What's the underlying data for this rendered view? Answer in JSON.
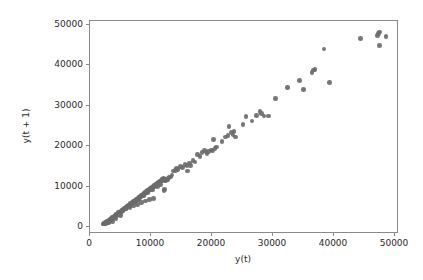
{
  "figure": {
    "background_color": "#ffffff",
    "width": 423,
    "height": 280
  },
  "axes": {
    "frame_color": "#8a8a8a",
    "left_px": 89,
    "top_px": 20,
    "right_px": 398,
    "bottom_px": 233
  },
  "chart_data": {
    "type": "scatter",
    "title": "",
    "xlabel": "y(t)",
    "ylabel": "y(t + 1)",
    "xlim": [
      -2200,
      52500
    ],
    "ylim": [
      -2400,
      52800
    ],
    "xticks": [
      0,
      10000,
      20000,
      30000,
      40000,
      50000
    ],
    "xticklabels": [
      "0",
      "10000",
      "20000",
      "30000",
      "40000",
      "50000"
    ],
    "yticks": [
      0,
      10000,
      20000,
      30000,
      40000,
      50000
    ],
    "yticklabels": [
      "0",
      "10000",
      "20000",
      "30000",
      "40000",
      "50000"
    ],
    "grid": false,
    "legend": null,
    "marker": {
      "shape": "circle",
      "color": "#6b6b6b",
      "size_px": 4.6
    },
    "series": [
      {
        "name": "lag-1 scatter",
        "color": "#6b6b6b",
        "points": [
          [
            300,
            250
          ],
          [
            420,
            380
          ],
          [
            520,
            300
          ],
          [
            610,
            520
          ],
          [
            700,
            640
          ],
          [
            760,
            500
          ],
          [
            840,
            720
          ],
          [
            900,
            860
          ],
          [
            980,
            760
          ],
          [
            1050,
            980
          ],
          [
            1120,
            900
          ],
          [
            1200,
            1150
          ],
          [
            1260,
            1040
          ],
          [
            1340,
            1260
          ],
          [
            1410,
            1380
          ],
          [
            1480,
            1290
          ],
          [
            1560,
            1500
          ],
          [
            1630,
            1620
          ],
          [
            1700,
            1540
          ],
          [
            1780,
            1760
          ],
          [
            1850,
            1680
          ],
          [
            1930,
            1900
          ],
          [
            2000,
            2030
          ],
          [
            2080,
            1950
          ],
          [
            2150,
            2180
          ],
          [
            2230,
            2100
          ],
          [
            2300,
            2330
          ],
          [
            2380,
            2450
          ],
          [
            2450,
            2370
          ],
          [
            2530,
            2600
          ],
          [
            2600,
            2520
          ],
          [
            2680,
            2750
          ],
          [
            2750,
            2880
          ],
          [
            2830,
            2800
          ],
          [
            2900,
            3030
          ],
          [
            2980,
            2950
          ],
          [
            3060,
            3180
          ],
          [
            3130,
            3300
          ],
          [
            3210,
            3220
          ],
          [
            3280,
            3450
          ],
          [
            3360,
            3370
          ],
          [
            3430,
            3600
          ],
          [
            3510,
            3730
          ],
          [
            3580,
            3650
          ],
          [
            3660,
            3880
          ],
          [
            3730,
            3800
          ],
          [
            3810,
            4030
          ],
          [
            3880,
            4150
          ],
          [
            3960,
            4070
          ],
          [
            4030,
            4300
          ],
          [
            4110,
            4220
          ],
          [
            4180,
            4450
          ],
          [
            4260,
            4580
          ],
          [
            4330,
            4500
          ],
          [
            4410,
            4730
          ],
          [
            4480,
            4650
          ],
          [
            4560,
            4880
          ],
          [
            4640,
            5000
          ],
          [
            4710,
            4920
          ],
          [
            4790,
            5150
          ],
          [
            4860,
            5070
          ],
          [
            4940,
            5300
          ],
          [
            5010,
            5430
          ],
          [
            5090,
            5350
          ],
          [
            5160,
            5580
          ],
          [
            5240,
            5500
          ],
          [
            5310,
            5730
          ],
          [
            5390,
            5850
          ],
          [
            5460,
            5770
          ],
          [
            5540,
            6000
          ],
          [
            5610,
            5920
          ],
          [
            5690,
            6150
          ],
          [
            5770,
            6280
          ],
          [
            5840,
            6200
          ],
          [
            5920,
            6430
          ],
          [
            5990,
            6350
          ],
          [
            6070,
            6580
          ],
          [
            6140,
            6700
          ],
          [
            6220,
            6620
          ],
          [
            6290,
            6850
          ],
          [
            6370,
            6770
          ],
          [
            6440,
            7000
          ],
          [
            6520,
            7130
          ],
          [
            6590,
            7050
          ],
          [
            6670,
            7280
          ],
          [
            6750,
            7200
          ],
          [
            6820,
            7430
          ],
          [
            6900,
            7550
          ],
          [
            6970,
            7470
          ],
          [
            7050,
            7700
          ],
          [
            7120,
            7620
          ],
          [
            7200,
            7850
          ],
          [
            7270,
            7980
          ],
          [
            7350,
            7900
          ],
          [
            7420,
            8130
          ],
          [
            7500,
            8050
          ],
          [
            7580,
            8280
          ],
          [
            7650,
            8400
          ],
          [
            7730,
            8320
          ],
          [
            7800,
            8550
          ],
          [
            7880,
            8470
          ],
          [
            7950,
            8700
          ],
          [
            8030,
            8830
          ],
          [
            8100,
            8750
          ],
          [
            8180,
            8980
          ],
          [
            8250,
            8900
          ],
          [
            8330,
            9130
          ],
          [
            8400,
            9250
          ],
          [
            8480,
            9170
          ],
          [
            8560,
            9400
          ],
          [
            8630,
            9320
          ],
          [
            8710,
            9550
          ],
          [
            8780,
            9680
          ],
          [
            8860,
            9600
          ],
          [
            8930,
            9830
          ],
          [
            9010,
            9750
          ],
          [
            9080,
            9980
          ],
          [
            9160,
            10100
          ],
          [
            9230,
            10020
          ],
          [
            9310,
            10250
          ],
          [
            9390,
            10170
          ],
          [
            9460,
            10400
          ],
          [
            9540,
            10530
          ],
          [
            9610,
            10450
          ],
          [
            9690,
            10680
          ],
          [
            9760,
            10600
          ],
          [
            9840,
            10830
          ],
          [
            9910,
            10950
          ],
          [
            9990,
            10870
          ],
          [
            10060,
            11100
          ],
          [
            10140,
            11020
          ],
          [
            10210,
            11250
          ],
          [
            10290,
            11380
          ],
          [
            10370,
            11300
          ],
          [
            10440,
            11530
          ],
          [
            10520,
            11450
          ],
          [
            10590,
            11680
          ],
          [
            10670,
            11800
          ],
          [
            10740,
            11720
          ],
          [
            10820,
            11950
          ],
          [
            10890,
            8900
          ],
          [
            10960,
            9100
          ],
          [
            11050,
            11400
          ],
          [
            11130,
            11600
          ],
          [
            11200,
            11500
          ],
          [
            11280,
            11750
          ],
          [
            11350,
            11650
          ],
          [
            11430,
            11900
          ],
          [
            11500,
            11800
          ],
          [
            11580,
            12050
          ],
          [
            9050,
            6800
          ],
          [
            8350,
            6500
          ],
          [
            7650,
            6100
          ],
          [
            6950,
            5700
          ],
          [
            6250,
            5300
          ],
          [
            5550,
            4900
          ],
          [
            4850,
            4500
          ],
          [
            4150,
            4100
          ],
          [
            3450,
            3700
          ],
          [
            2750,
            3300
          ],
          [
            12600,
            13900
          ],
          [
            12900,
            14100
          ],
          [
            13100,
            14600
          ],
          [
            13400,
            14300
          ],
          [
            13800,
            15100
          ],
          [
            14200,
            14800
          ],
          [
            14600,
            15600
          ],
          [
            15000,
            15300
          ],
          [
            15100,
            13900
          ],
          [
            15400,
            16000
          ],
          [
            15600,
            15400
          ],
          [
            16000,
            16600
          ],
          [
            16400,
            16300
          ],
          [
            16800,
            18200
          ],
          [
            17300,
            17700
          ],
          [
            17600,
            18700
          ],
          [
            18100,
            19300
          ],
          [
            18300,
            18900
          ],
          [
            18500,
            18400
          ],
          [
            18800,
            19000
          ],
          [
            19200,
            19400
          ],
          [
            19500,
            19200
          ],
          [
            19700,
            22100
          ],
          [
            19900,
            19700
          ],
          [
            20200,
            20100
          ],
          [
            21200,
            21600
          ],
          [
            21800,
            22700
          ],
          [
            22200,
            23200
          ],
          [
            22400,
            25500
          ],
          [
            22800,
            23900
          ],
          [
            23100,
            23300
          ],
          [
            23300,
            24100
          ],
          [
            23600,
            22700
          ],
          [
            24900,
            25900
          ],
          [
            25400,
            28000
          ],
          [
            26500,
            26900
          ],
          [
            27300,
            28300
          ],
          [
            27900,
            29400
          ],
          [
            28200,
            28900
          ],
          [
            28600,
            28200
          ],
          [
            29400,
            28200
          ],
          [
            30600,
            32700
          ],
          [
            32800,
            35500
          ],
          [
            34900,
            37400
          ],
          [
            35600,
            35000
          ],
          [
            37100,
            39500
          ],
          [
            37400,
            40100
          ],
          [
            37600,
            40200
          ],
          [
            39200,
            45500
          ],
          [
            40200,
            36800
          ],
          [
            45700,
            48300
          ],
          [
            48700,
            49000
          ],
          [
            48900,
            49600
          ],
          [
            49000,
            50000
          ],
          [
            49100,
            46500
          ],
          [
            50200,
            48800
          ],
          [
            1800,
            900
          ],
          [
            2400,
            1500
          ],
          [
            3200,
            2400
          ],
          [
            1100,
            400
          ],
          [
            12000,
            12400
          ],
          [
            12300,
            12900
          ],
          [
            11800,
            12200
          ],
          [
            10300,
            10500
          ],
          [
            9700,
            9900
          ],
          [
            8900,
            9000
          ],
          [
            8100,
            8200
          ],
          [
            7300,
            7400
          ],
          [
            6500,
            6600
          ],
          [
            5700,
            5800
          ],
          [
            4900,
            5000
          ],
          [
            4100,
            4200
          ],
          [
            3300,
            3400
          ],
          [
            2500,
            2600
          ],
          [
            1700,
            1800
          ],
          [
            900,
            1000
          ],
          [
            500,
            600
          ],
          [
            200,
            150
          ],
          [
            350,
            420
          ],
          [
            150,
            200
          ]
        ]
      }
    ]
  },
  "xtick_positions_px": [
    89,
    150,
    211,
    272,
    333,
    394
  ],
  "ytick_positions_px": [
    226,
    186,
    145,
    105,
    64,
    24
  ]
}
